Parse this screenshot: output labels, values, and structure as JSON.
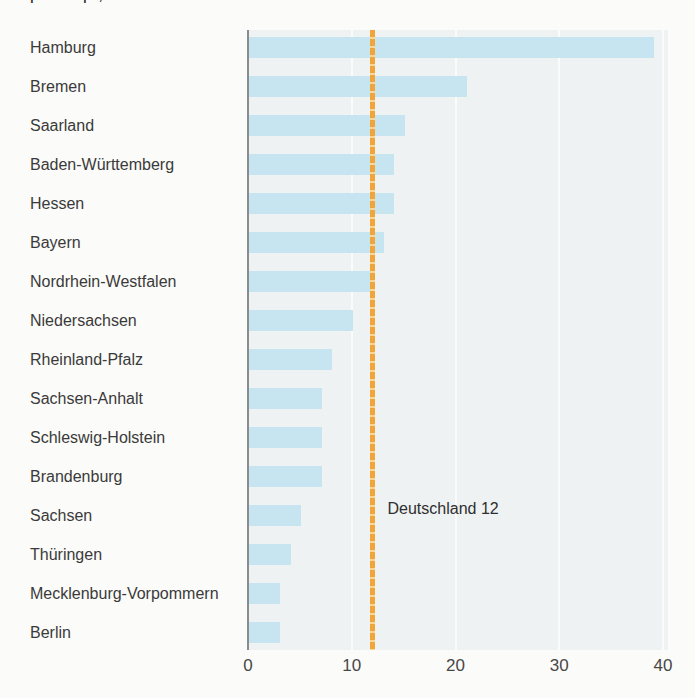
{
  "page": {
    "background": "#fbfbf9",
    "top_cropped_line": "pro Kopf, in Prozent"
  },
  "chart_data": {
    "type": "bar",
    "orientation": "horizontal",
    "categories": [
      "Hamburg",
      "Bremen",
      "Saarland",
      "Baden-Württemberg",
      "Hessen",
      "Bayern",
      "Nordrhein-Westfalen",
      "Niedersachsen",
      "Rheinland-Pfalz",
      "Sachsen-Anhalt",
      "Schleswig-Holstein",
      "Brandenburg",
      "Sachsen",
      "Thüringen",
      "Mecklenburg-Vorpommern",
      "Berlin"
    ],
    "values": [
      39,
      21,
      15,
      14,
      14,
      13,
      12,
      10,
      8,
      7,
      7,
      7,
      5,
      4,
      3,
      3
    ],
    "x_ticks": [
      0,
      10,
      20,
      30,
      40
    ],
    "xlim": [
      0,
      40
    ],
    "grid": "vertical-white",
    "reference_line": {
      "label": "Deutschland 12",
      "value": 12,
      "style": "dashed"
    },
    "colors": {
      "bar": "#c7e4f1",
      "plot_background": "#eff2f3",
      "gridline": "#fafbfb",
      "axis_line": "#888c8f",
      "reference": "#f0a53a",
      "reference_gap": "#f6d79c",
      "label_text": "#3a3a3a",
      "tick_text": "#474747"
    }
  }
}
